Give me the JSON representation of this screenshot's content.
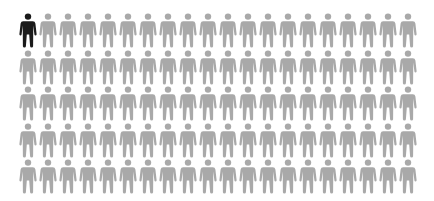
{
  "chart_data": {
    "type": "pictogram",
    "title": "",
    "total": 100,
    "highlighted": 1,
    "rows": 5,
    "columns": 20,
    "series": [
      {
        "name": "highlighted",
        "value": 1,
        "color": "#1a1a1a"
      },
      {
        "name": "other",
        "value": 99,
        "color": "#a9a9a9"
      }
    ],
    "icon": "person-icon"
  }
}
